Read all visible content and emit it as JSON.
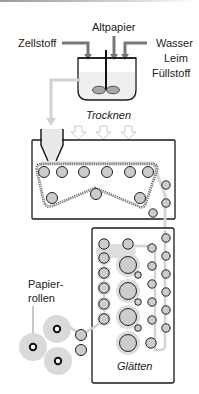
{
  "diagram": {
    "inputs": {
      "left": "Zellstoff",
      "top": "Altpapier",
      "right_line1": "Wasser",
      "right_line2": "Leim",
      "right_line3": "Füllstoff"
    },
    "stages": {
      "drying": "Trocknen",
      "smoothing": "Glätten",
      "output_line1": "Papier-",
      "output_line2": "rollen"
    },
    "icons": {
      "vat": "mixing-vat-icon",
      "stirrer": "stirrer-icon",
      "headbox": "headbox-funnel-icon",
      "heat_arrows": "down-arrow-icon",
      "rollers": "roller-icon",
      "paper_roll": "paper-roll-icon"
    },
    "colors": {
      "outline": "#1a1a1a",
      "roller_fill": "#c8c8c8",
      "halo": "#dcdcdc",
      "paper_path": "#d0d0d0",
      "felt_dots": "#555555"
    }
  }
}
